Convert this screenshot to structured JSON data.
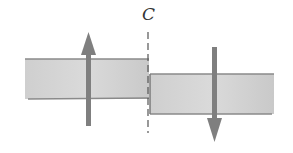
{
  "diagram": {
    "section_label": "C",
    "elements": [
      {
        "name": "left-beam-segment",
        "shape": "rectangle"
      },
      {
        "name": "right-beam-segment",
        "shape": "rectangle"
      },
      {
        "name": "section-line",
        "style": "dashed",
        "label": "C"
      },
      {
        "name": "upward-shear-force-arrow",
        "direction": "up",
        "on": "left-beam-segment"
      },
      {
        "name": "downward-shear-force-arrow",
        "direction": "down",
        "on": "right-beam-segment"
      }
    ],
    "colors": {
      "beam_fill": "#c8c8c8",
      "beam_edge": "#8a8a8a",
      "arrow": "#7f7f7f",
      "dashed_line": "#555555"
    }
  }
}
